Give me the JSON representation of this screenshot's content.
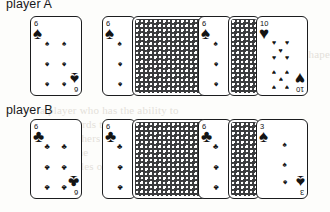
{
  "page": {
    "width": 322,
    "height": 212,
    "background": "#fdfdfb",
    "ink": "#1b1c1e"
  },
  "bleed_text": [
    {
      "text": "difficulty",
      "x": 196,
      "y": 34
    },
    {
      "text": "of the hand, and the shape",
      "x": 210,
      "y": 48
    },
    {
      "text": "that the player is",
      "x": 214,
      "y": 60
    },
    {
      "text": "table",
      "x": 200,
      "y": 72
    },
    {
      "text": "a player who has the ability to",
      "x": 40,
      "y": 104
    },
    {
      "text": "the cards they keep in the",
      "x": 55,
      "y": 118
    },
    {
      "text": "and the others in",
      "x": 36,
      "y": 132
    },
    {
      "text": "on the",
      "x": 60,
      "y": 146
    },
    {
      "text": "12 the rules on",
      "x": 40,
      "y": 160
    }
  ],
  "rows": [
    {
      "id": "row-a",
      "label": "player A",
      "label_x": 6,
      "label_y": -3,
      "top": 16,
      "groups": [
        {
          "id": "group-a-1",
          "x": 30,
          "cards": [
            {
              "kind": "face",
              "x": 0,
              "partial": false,
              "rank": "6",
              "suit": "spades",
              "glyph": "♠",
              "pip_layout": "six"
            }
          ]
        },
        {
          "id": "group-a-2",
          "x": 102,
          "cards": [
            {
              "kind": "face",
              "x": 0,
              "partial": true,
              "rank": "6",
              "suit": "spades",
              "glyph": "♠",
              "pip_layout": "six-partial"
            },
            {
              "kind": "back",
              "x": 30,
              "width": 88
            }
          ]
        },
        {
          "id": "group-a-3",
          "x": 198,
          "cards": [
            {
              "kind": "face",
              "x": 0,
              "partial": true,
              "rank": "6",
              "suit": "spades",
              "glyph": "♠",
              "pip_layout": "six-partial"
            },
            {
              "kind": "back",
              "x": 30,
              "width": 32
            },
            {
              "kind": "face",
              "x": 58,
              "partial": false,
              "rank": "10",
              "suit": "hearts",
              "glyph": "♥",
              "pip_layout": "ten"
            }
          ]
        }
      ]
    },
    {
      "id": "row-b",
      "label": "player B",
      "label_x": 6,
      "label_y": 0,
      "top": 119,
      "groups": [
        {
          "id": "group-b-1",
          "x": 30,
          "cards": [
            {
              "kind": "face",
              "x": 0,
              "partial": false,
              "rank": "6",
              "suit": "clubs",
              "glyph": "♣",
              "pip_layout": "six"
            }
          ]
        },
        {
          "id": "group-b-2",
          "x": 102,
          "cards": [
            {
              "kind": "face",
              "x": 0,
              "partial": true,
              "rank": "6",
              "suit": "clubs",
              "glyph": "♣",
              "pip_layout": "six-partial"
            },
            {
              "kind": "back",
              "x": 30,
              "width": 88
            }
          ]
        },
        {
          "id": "group-b-3",
          "x": 198,
          "cards": [
            {
              "kind": "face",
              "x": 0,
              "partial": true,
              "rank": "6",
              "suit": "clubs",
              "glyph": "♣",
              "pip_layout": "six-partial"
            },
            {
              "kind": "back",
              "x": 30,
              "width": 32
            },
            {
              "kind": "face",
              "x": 58,
              "partial": false,
              "rank": "3",
              "suit": "spades",
              "glyph": "♠",
              "pip_layout": "three"
            }
          ]
        }
      ]
    }
  ],
  "pip_layouts": {
    "six": [
      [
        32,
        27
      ],
      [
        66,
        27
      ],
      [
        32,
        47
      ],
      [
        66,
        47
      ],
      [
        32,
        67
      ],
      [
        66,
        67
      ]
    ],
    "six-partial": [
      [
        52,
        27
      ],
      [
        52,
        47
      ],
      [
        52,
        67
      ]
    ],
    "ten": [
      [
        34,
        25
      ],
      [
        60,
        25
      ],
      [
        34,
        40
      ],
      [
        60,
        40
      ],
      [
        34,
        55
      ],
      [
        60,
        55
      ],
      [
        34,
        70
      ],
      [
        60,
        70
      ],
      [
        47,
        33
      ],
      [
        47,
        62
      ]
    ],
    "three": [
      [
        55,
        25
      ],
      [
        55,
        45
      ],
      [
        55,
        62
      ]
    ]
  }
}
